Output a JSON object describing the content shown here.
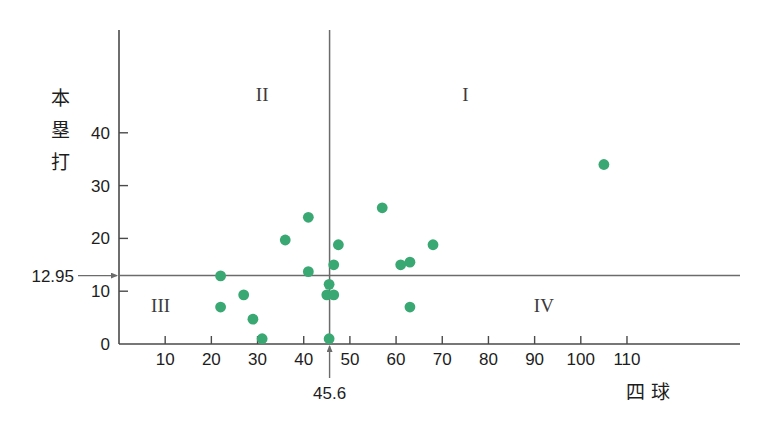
{
  "chart_data": {
    "type": "scatter",
    "title": "",
    "xlabel": "四 球",
    "ylabel": "本塁打",
    "xlim": [
      0,
      118
    ],
    "ylim": [
      0,
      53
    ],
    "grid": false,
    "legend": "none",
    "xticks": [
      10,
      20,
      30,
      40,
      50,
      60,
      70,
      80,
      90,
      100,
      110
    ],
    "yticks": [
      0,
      10,
      20,
      30,
      40
    ],
    "reference_lines": {
      "vertical": {
        "value": 45.6,
        "label": "45.6",
        "axis": "x"
      },
      "horizontal": {
        "value": 12.95,
        "label": "12.95",
        "axis": "y"
      }
    },
    "quadrant_labels": [
      {
        "name": "I",
        "x": 75,
        "y": 46
      },
      {
        "name": "II",
        "x": 31,
        "y": 46
      },
      {
        "name": "III",
        "x": 9,
        "y": 6
      },
      {
        "name": "IV",
        "x": 92,
        "y": 6
      }
    ],
    "point_color": "#3aa873",
    "points": [
      {
        "x": 22.0,
        "y": 12.9
      },
      {
        "x": 22.0,
        "y": 7.0
      },
      {
        "x": 27.0,
        "y": 9.3
      },
      {
        "x": 29.0,
        "y": 4.7
      },
      {
        "x": 31.0,
        "y": 1.0
      },
      {
        "x": 36.0,
        "y": 19.7
      },
      {
        "x": 41.0,
        "y": 24.0
      },
      {
        "x": 41.0,
        "y": 13.7
      },
      {
        "x": 45.0,
        "y": 9.3
      },
      {
        "x": 45.5,
        "y": 11.3
      },
      {
        "x": 45.5,
        "y": 1.0
      },
      {
        "x": 46.5,
        "y": 9.3
      },
      {
        "x": 46.5,
        "y": 15.0
      },
      {
        "x": 47.5,
        "y": 18.8
      },
      {
        "x": 57.0,
        "y": 25.8
      },
      {
        "x": 61.0,
        "y": 15.0
      },
      {
        "x": 63.0,
        "y": 7.0
      },
      {
        "x": 63.0,
        "y": 15.5
      },
      {
        "x": 68.0,
        "y": 18.8
      },
      {
        "x": 105.0,
        "y": 34.0
      }
    ]
  },
  "labels": {
    "y_axis_title_chars": [
      "本",
      "塁",
      "打"
    ],
    "x_axis_title": "四 球",
    "horizontal_ref_label": "12.95",
    "vertical_ref_label": "45.6"
  }
}
